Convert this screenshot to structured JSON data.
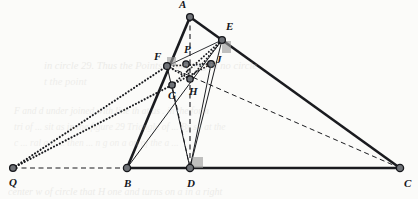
{
  "figure": {
    "width": 418,
    "height": 199,
    "background_color": "#fbfbf9",
    "ink_color": "#1a1b1f",
    "vertex_fill": "#6f7277",
    "vertex_stroke": "#16171b",
    "right_angle_fill": "#9a9a9a",
    "points": [
      {
        "id": "A",
        "label": "A",
        "x": 190,
        "y": 17,
        "label_dx": -11,
        "label_dy": -12,
        "r": 3.4
      },
      {
        "id": "E",
        "label": "E",
        "x": 222,
        "y": 40,
        "label_dx": 4,
        "label_dy": -13,
        "r": 3.4
      },
      {
        "id": "P",
        "label": "P",
        "x": 186,
        "y": 64,
        "label_dx": -2,
        "label_dy": -14,
        "r": 3.2
      },
      {
        "id": "F",
        "label": "F",
        "x": 167,
        "y": 66,
        "label_dx": -13,
        "label_dy": -9,
        "r": 3.4
      },
      {
        "id": "J",
        "label": "J",
        "x": 211,
        "y": 64,
        "label_dx": 5,
        "label_dy": -4,
        "r": 3.4
      },
      {
        "id": "G",
        "label": "G",
        "x": 172,
        "y": 85,
        "label_dx": -4,
        "label_dy": 11,
        "r": 3.2
      },
      {
        "id": "H",
        "label": "H",
        "x": 190,
        "y": 79,
        "label_dx": -1,
        "label_dy": 13,
        "r": 3.2
      },
      {
        "id": "Q",
        "label": "Q",
        "x": 13,
        "y": 168,
        "label_dx": -4,
        "label_dy": 15,
        "r": 3.4
      },
      {
        "id": "B",
        "label": "B",
        "x": 127,
        "y": 168,
        "label_dx": -3,
        "label_dy": 16,
        "r": 3.6
      },
      {
        "id": "D",
        "label": "D",
        "x": 190,
        "y": 168,
        "label_dx": -3,
        "label_dy": 16,
        "r": 3.6
      },
      {
        "id": "C",
        "label": "C",
        "x": 400,
        "y": 168,
        "label_dx": 4,
        "label_dy": 16,
        "r": 3.6
      }
    ],
    "segments": [
      {
        "id": "AB",
        "from": "A",
        "to": "B",
        "style": "solid",
        "width": 2.6
      },
      {
        "id": "AC",
        "from": "A",
        "to": "C",
        "style": "solid",
        "width": 2.6
      },
      {
        "id": "BC",
        "from": "B",
        "to": "C",
        "style": "solid",
        "width": 2.6
      },
      {
        "id": "AD",
        "from": "A",
        "to": "D",
        "style": "dashed",
        "width": 1.1
      },
      {
        "id": "DE",
        "from": "D",
        "to": "E",
        "style": "solid",
        "width": 1.0
      },
      {
        "id": "DF",
        "from": "D",
        "to": "F",
        "style": "solid",
        "width": 1.0
      },
      {
        "id": "DJ",
        "from": "D",
        "to": "J",
        "style": "solid",
        "width": 1.0
      },
      {
        "id": "DG",
        "from": "D",
        "to": "G",
        "style": "dashed",
        "width": 1.0
      },
      {
        "id": "FE",
        "from": "F",
        "to": "E",
        "style": "solid",
        "width": 0.9
      },
      {
        "id": "FJ",
        "from": "F",
        "to": "J",
        "style": "dotted",
        "width": 1.9
      },
      {
        "id": "GE",
        "from": "G",
        "to": "E",
        "style": "dotted",
        "width": 1.9
      },
      {
        "id": "GJ",
        "from": "G",
        "to": "J",
        "style": "dotted",
        "width": 1.9
      },
      {
        "id": "HE",
        "from": "H",
        "to": "E",
        "style": "dotted",
        "width": 1.9
      },
      {
        "id": "FH",
        "from": "F",
        "to": "H",
        "style": "dotted",
        "width": 1.9
      },
      {
        "id": "PH",
        "from": "P",
        "to": "H",
        "style": "dotted",
        "width": 1.9
      },
      {
        "id": "QF",
        "from": "Q",
        "to": "F",
        "style": "dotted",
        "width": 2.1
      },
      {
        "id": "QG",
        "from": "Q",
        "to": "G",
        "style": "dotted",
        "width": 2.1
      },
      {
        "id": "QB",
        "from": "Q",
        "to": "B",
        "style": "dashed",
        "width": 1.0
      },
      {
        "id": "CF",
        "from": "C",
        "to": "F",
        "style": "dashed",
        "width": 1.0
      },
      {
        "id": "BE",
        "from": "B",
        "to": "E",
        "style": "solid",
        "width": 1.0
      },
      {
        "id": "CE",
        "from": "C",
        "to": "E",
        "style": "dashed",
        "width": 1.0
      }
    ],
    "right_angle_markers": [
      {
        "id": "at-D",
        "x": 192,
        "y": 157,
        "w": 11,
        "h": 11,
        "label": "right-angle-at-D"
      },
      {
        "id": "at-E",
        "x": 222,
        "y": 41,
        "w": 9,
        "h": 12,
        "label": "right-angle-at-E"
      },
      {
        "id": "at-F",
        "x": 167,
        "y": 57,
        "w": 9,
        "h": 9,
        "label": "right-angle-at-F"
      }
    ]
  },
  "bleed_text": [
    {
      "id": "line1",
      "text": "in circle 29. Thus the Points ... mo ting in no circle",
      "x": 44,
      "y": 60,
      "size": 10.5,
      "opacity": 0.3
    },
    {
      "id": "line2",
      "text": "t the point",
      "x": 44,
      "y": 76,
      "size": 10.5,
      "opacity": 0.26
    },
    {
      "id": "line3",
      "text": "F  and  d  under  joined  with  line  th  at  us  .  in  the  form",
      "x": 14,
      "y": 106,
      "size": 9.5,
      "opacity": 0.28
    },
    {
      "id": "line4",
      "text": "tri  of  ...  sit  as  in  the  figure 29  Triangle  of  ...  By  sa  at  the",
      "x": 14,
      "y": 122,
      "size": 9.5,
      "opacity": 0.26
    },
    {
      "id": "line5",
      "text": "c  ...  ral  a  b  ...  then  ...  n  g  on  a  on  of  the  a  ...",
      "x": 14,
      "y": 138,
      "size": 9.5,
      "opacity": 0.24
    },
    {
      "id": "line6",
      "text": "center  w  of  circle  that  H  one  and  turns  on  a  in  a  right",
      "x": 8,
      "y": 186,
      "size": 10.0,
      "opacity": 0.3
    }
  ]
}
